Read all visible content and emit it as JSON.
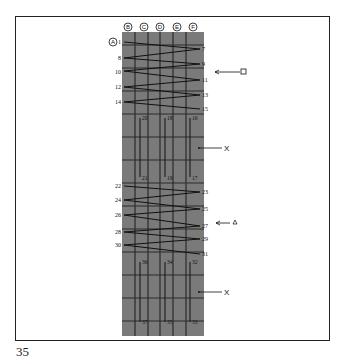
{
  "page": {
    "number": "35"
  },
  "diagram": {
    "column_labels": [
      "B",
      "C",
      "D",
      "E",
      "F"
    ],
    "row_label": "A",
    "left_numbers": [
      "1",
      "8",
      "10",
      "12",
      "14",
      "22",
      "24",
      "26",
      "28",
      "30"
    ],
    "right_numbers": [
      "7",
      "9",
      "11",
      "13",
      "15",
      "23",
      "25",
      "27",
      "29",
      "31"
    ],
    "vertical_top_1": [
      "20",
      "18",
      "16"
    ],
    "vertical_bottom_1": [
      "21",
      "19",
      "17"
    ],
    "vertical_top_2": [
      "36",
      "34",
      "32"
    ],
    "vertical_bottom_2": [
      "37",
      "35",
      "33"
    ],
    "markers": [
      {
        "symbol": "□",
        "target": "11"
      },
      {
        "symbol": "X",
        "target": "middle-1"
      },
      {
        "symbol": "△",
        "target": "27"
      },
      {
        "symbol": "X",
        "target": "middle-2"
      }
    ],
    "colors": {
      "panel": "#7a7a7a",
      "grid": "#2a2a2a",
      "ink": "#111111"
    }
  }
}
